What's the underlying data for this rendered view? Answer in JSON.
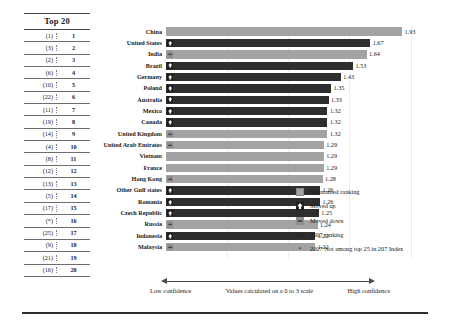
{
  "table": {
    "header": "Top 20",
    "col_prev_note": "2007 ranking",
    "col_cur_note": "current ranking"
  },
  "axis": {
    "low_label": "Low confidence",
    "mid_label": "Values calculated on a 0 to 3 scale",
    "high_label": "High confidence"
  },
  "legend": {
    "items": [
      {
        "key": "maintained",
        "label": "Maintained ranking",
        "swatch": "gray-square"
      },
      {
        "key": "up",
        "label": "Moved up",
        "swatch": "dark-square-up-arrow"
      },
      {
        "key": "down",
        "label": "Moved down",
        "swatch": "gray-square-down-arrow"
      },
      {
        "key": "prev-rank",
        "label": "2007 ranking",
        "swatch": "(#)"
      },
      {
        "key": "not-ranked",
        "label": "2007 Not among top 25 in 207 Index",
        "swatch": "*"
      }
    ]
  },
  "colors": {
    "maintained": "#a3a3a3",
    "moved_up": "#2e2e2e",
    "moved_down": "#a3a3a3",
    "axis": "#4a4a4a",
    "grid": "#ededed"
  },
  "chart_data": {
    "type": "bar",
    "orientation": "horizontal",
    "title": "Top 20",
    "xlabel": "Values calculated on a 0 to 3 scale",
    "ylabel": "",
    "xlim": [
      0,
      2.2
    ],
    "grid": true,
    "legend_position": "right",
    "categories": [
      "China",
      "United States",
      "India",
      "Brazil",
      "Germany",
      "Poland",
      "Australia",
      "Mexico",
      "Canada",
      "United Kingdom",
      "United Arab Emirates",
      "Vietnam",
      "France",
      "Hong Kong",
      "Other Gulf states",
      "Romania",
      "Czech Republic",
      "Russia",
      "Indonesia",
      "Malaysia"
    ],
    "values": [
      1.93,
      1.67,
      1.64,
      1.53,
      1.43,
      1.35,
      1.33,
      1.32,
      1.32,
      1.32,
      1.29,
      1.29,
      1.29,
      1.28,
      1.26,
      1.26,
      1.25,
      1.24,
      1.22,
      1.22
    ],
    "current_rank": [
      1,
      2,
      3,
      4,
      5,
      6,
      7,
      8,
      9,
      10,
      11,
      12,
      13,
      14,
      15,
      16,
      17,
      18,
      19,
      20
    ],
    "previous_rank": [
      "(1)",
      "(3)",
      "(2)",
      "(6)",
      "(10)",
      "(22)",
      "(11)",
      "(19)",
      "(14)",
      "(4)",
      "(8)",
      "(12)",
      "(13)",
      "(5)",
      "(17)",
      "(*)",
      "(25)",
      "(9)",
      "(21)",
      "(16)"
    ],
    "movement": [
      "maintained",
      "up",
      "down",
      "up",
      "up",
      "up",
      "up",
      "up",
      "up",
      "down",
      "down",
      "maintained",
      "maintained",
      "down",
      "up",
      "up",
      "up",
      "down",
      "up",
      "down"
    ],
    "value_labels": [
      "1.93",
      "1.67",
      "1.64",
      "1.53",
      "1.43",
      "1.35",
      "1.33",
      "1.32",
      "1.32",
      "1.32",
      "1.29",
      "1.29",
      "1.29",
      "1.28",
      "1.26",
      "1.26",
      "1.25",
      "1.24",
      "1.22",
      "1.22"
    ]
  }
}
